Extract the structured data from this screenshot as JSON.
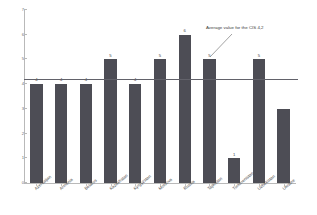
{
  "chart_data": {
    "type": "bar",
    "title": "",
    "subtitle": "",
    "xlabel": "",
    "ylabel": "",
    "ylim": [
      0,
      7
    ],
    "ytick_labels": [
      "0",
      "1",
      "2",
      "3",
      "4",
      "5",
      "6",
      "7"
    ],
    "ytick_values": [
      0,
      1,
      2,
      3,
      4,
      5,
      6,
      7
    ],
    "grid": false,
    "legend": "none",
    "categories": [
      "Azerbaijan",
      "Armenia",
      "Belarus",
      "Kazakhstan",
      "Kyrgyzstan",
      "Moldova",
      "Russia",
      "Tajikistan",
      "Turkmenistan",
      "Uzbekistan",
      "Ukraine"
    ],
    "values": [
      4,
      4,
      4,
      5,
      4,
      5,
      6,
      5,
      1,
      5,
      3
    ],
    "data_labels": [
      "4",
      "4",
      "4",
      "5",
      "4",
      "5",
      "6",
      "5",
      "1",
      "5",
      ""
    ],
    "bar_color": "#4d4d55",
    "reference_line": {
      "value": 4.2,
      "label": "Average value for the CIS 4,2",
      "color": "#62626a"
    },
    "axis_color": "#b9b9b9"
  }
}
